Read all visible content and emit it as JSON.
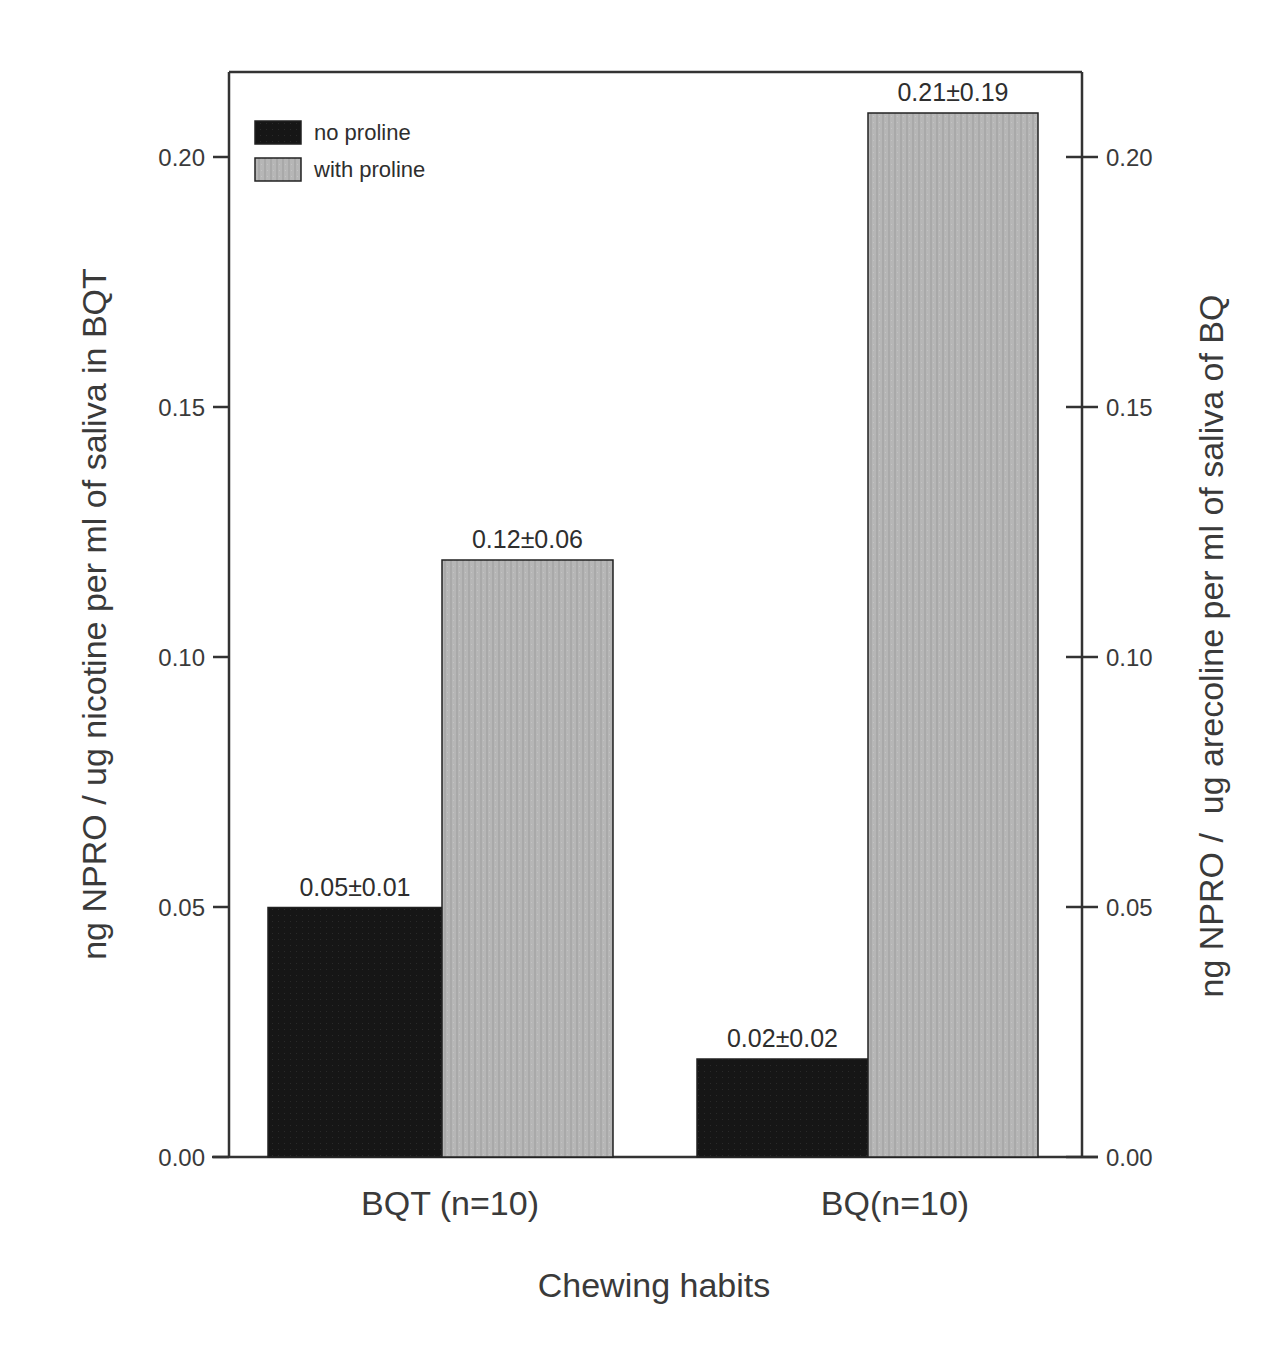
{
  "chart_data": {
    "type": "bar",
    "title": "",
    "xlabel": "Chewing habits",
    "ylabel": "ng NPRO / ug nicotine per ml of saliva in BQT",
    "ylabel_right": "ng NPRO /  ug arecoline per ml of saliva of BQ",
    "categories": [
      "BQT (n=10)",
      "BQ(n=10)"
    ],
    "series": [
      {
        "name": "no proline",
        "color": "#1a1a1a",
        "values": [
          0.05,
          0.02
        ],
        "labels": [
          "0.05±0.01",
          "0.02±0.02"
        ],
        "errors": [
          0.01,
          0.02
        ]
      },
      {
        "name": "with proline",
        "color": "#b4b4b4",
        "values": [
          0.12,
          0.21
        ],
        "labels": [
          "0.12±0.06",
          "0.21±0.19"
        ],
        "errors": [
          0.06,
          0.19
        ]
      }
    ],
    "ylim": [
      0,
      0.217
    ],
    "yticks": [
      "0.00",
      "0.05",
      "0.10",
      "0.15",
      "0.20"
    ],
    "ytick_values": [
      0,
      0.05,
      0.1,
      0.15,
      0.2
    ],
    "yticks_right": [
      "0.00",
      "0.05",
      "0.10",
      "0.15",
      "0.20"
    ],
    "grid": false,
    "legend_position": "upper left"
  },
  "layout": {
    "plot_left": 229,
    "plot_right": 1082,
    "plot_top": 72,
    "plot_bottom": 1157,
    "px_per_unit": 5000,
    "bar_groups": [
      {
        "black_x": 268,
        "black_w": 174,
        "gray_x": 442,
        "gray_w": 171
      },
      {
        "black_x": 697,
        "black_w": 171,
        "gray_x": 868,
        "gray_w": 170
      }
    ]
  }
}
